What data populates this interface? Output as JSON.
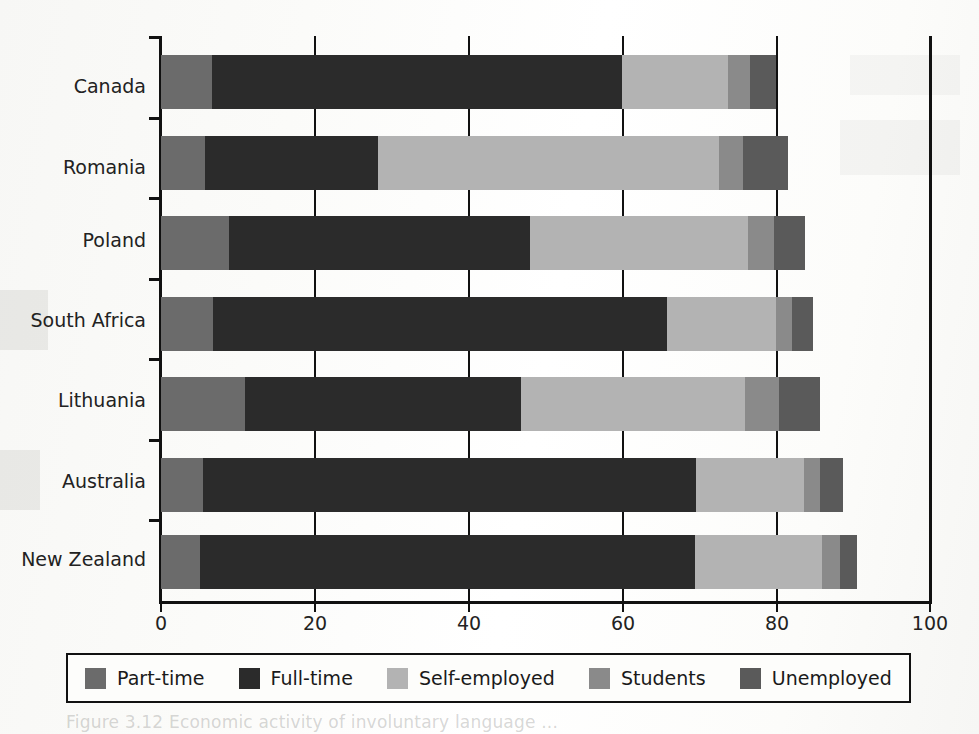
{
  "chart_data": {
    "type": "bar",
    "orientation": "horizontal",
    "stacked": true,
    "title": "",
    "xlabel": "",
    "ylabel": "",
    "xlim": [
      0,
      100
    ],
    "xticks": [
      0,
      20,
      40,
      60,
      80,
      100
    ],
    "xtick_labels": [
      "0",
      "20",
      "40",
      "60",
      "80",
      "100"
    ],
    "grid": false,
    "legend_position": "below-axes",
    "categories": [
      "Canada",
      "Romania",
      "Poland",
      "South Africa",
      "Lithuania",
      "Australia",
      "New Zealand"
    ],
    "series": [
      {
        "name": "Part-time",
        "color": "#6b6b6b",
        "values": [
          6.6,
          5.7,
          8.8,
          6.8,
          10.9,
          5.5,
          5.1
        ]
      },
      {
        "name": "Full-time",
        "color": "#2b2b2b",
        "values": [
          53.4,
          22.5,
          39.2,
          59.0,
          35.9,
          64.1,
          64.3
        ]
      },
      {
        "name": "Self-employed",
        "color": "#b3b3b3",
        "values": [
          13.7,
          44.3,
          28.3,
          14.2,
          29.2,
          14.0,
          16.6
        ]
      },
      {
        "name": "Students",
        "color": "#8a8a8a",
        "values": [
          2.9,
          3.2,
          3.4,
          2.0,
          4.4,
          2.1,
          2.3
        ]
      },
      {
        "name": "Unemployed",
        "color": "#5a5a5a",
        "values": [
          3.4,
          5.8,
          4.0,
          2.8,
          5.3,
          3.0,
          2.2
        ]
      }
    ],
    "totals": [
      80.0,
      81.5,
      83.7,
      84.8,
      85.7,
      88.7,
      90.5
    ]
  },
  "legend": {
    "items": [
      {
        "label": "Part-time",
        "color": "#6b6b6b"
      },
      {
        "label": "Full-time",
        "color": "#2b2b2b"
      },
      {
        "label": "Self-employed",
        "color": "#b3b3b3"
      },
      {
        "label": "Students",
        "color": "#8a8a8a"
      },
      {
        "label": "Unemployed",
        "color": "#5a5a5a"
      }
    ]
  },
  "caption": {
    "ghost_text": "Figure 3.12 Economic activity of involuntary language ..."
  }
}
